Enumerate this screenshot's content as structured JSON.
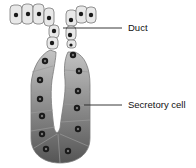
{
  "diagram": {
    "labels": {
      "duct": "Duct",
      "secretory_cell": "Secretory cell"
    },
    "colors": {
      "epithelial_cell_fill": "#e4e4e4",
      "cell_outline": "#7a7a7a",
      "nucleus": "#1a1a1a",
      "secretory_light": "#b8b8b8",
      "secretory_dark": "#5e5e5e",
      "leader_line": "#222222"
    }
  }
}
